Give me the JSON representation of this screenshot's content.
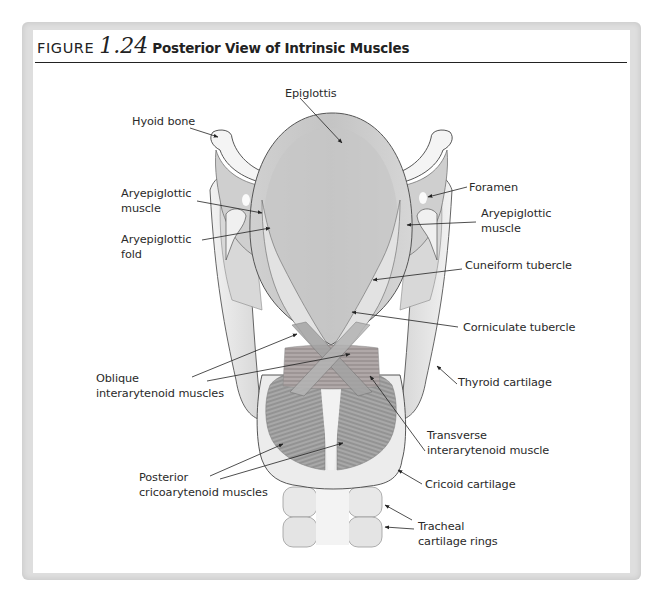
{
  "figure": {
    "prefix": "FIGURE",
    "number": "1.24",
    "title": "Posterior View of Intrinsic Muscles"
  },
  "labels": {
    "epiglottis": "Epiglottis",
    "hyoid_bone": "Hyoid bone",
    "aryepiglottic_muscle_left_1": "Aryepiglottic",
    "aryepiglottic_muscle_left_2": "muscle",
    "aryepiglottic_fold_1": "Aryepiglottic",
    "aryepiglottic_fold_2": "fold",
    "foramen": "Foramen",
    "aryepiglottic_muscle_right_1": "Aryepiglottic",
    "aryepiglottic_muscle_right_2": "muscle",
    "cuneiform_tubercle": "Cuneiform tubercle",
    "corniculate_tubercle": "Corniculate tubercle",
    "thyroid_cartilage": "Thyroid cartilage",
    "oblique_interarytenoid_1": "Oblique",
    "oblique_interarytenoid_2": "interarytenoid muscles",
    "transverse_interarytenoid_1": "Transverse",
    "transverse_interarytenoid_2": "interarytenoid muscle",
    "posterior_cricoarytenoid_1": "Posterior",
    "posterior_cricoarytenoid_2": "cricoarytenoid muscles",
    "cricoid_cartilage": "Cricoid cartilage",
    "tracheal_rings_1": "Tracheal",
    "tracheal_rings_2": "cartilage rings"
  },
  "colors": {
    "frame": "#dedede",
    "rule": "#222222",
    "text": "#2a2a2a",
    "cartilage": "#e6e6e6",
    "muscle": "#9a9a9a"
  }
}
